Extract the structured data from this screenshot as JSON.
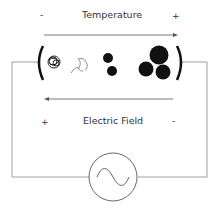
{
  "top": {
    "minus": "-",
    "title": "Temperature",
    "plus": "+"
  },
  "bottom": {
    "plus": "+",
    "title": "Electric Field",
    "minus": "-"
  },
  "icons": {
    "source": "ac-source-icon",
    "particles": [
      "tangled-coil-particle",
      "wavy-strand-particle",
      "two-small-dots-particle",
      "three-large-balls-particle"
    ]
  },
  "colors": {
    "stroke": "#555555",
    "particle": "#111111",
    "wire": "#888888"
  }
}
